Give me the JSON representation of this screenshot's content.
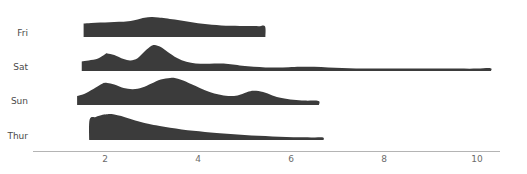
{
  "chart_data": {
    "type": "area",
    "subtype": "ridgeline",
    "title": "",
    "subtitle": "",
    "xlabel": "",
    "ylabel": "",
    "grid": false,
    "legend": null,
    "orientation": "horizontal",
    "fill_color": "#3b3b3b",
    "axis_color": "#b4b4b4",
    "label_color": "#4a4a4a",
    "tick_color": "#6b6b6b",
    "background": "#ffffff",
    "xlim": [
      0.2,
      10.8
    ],
    "xticks": [
      2,
      4,
      6,
      8,
      10
    ],
    "xtick_labels": [
      "2",
      "4",
      "6",
      "8",
      "10"
    ],
    "categories": [
      "Fri",
      "Sat",
      "Sun",
      "Thur"
    ],
    "series": [
      {
        "name": "Fri",
        "baseline_y": 37,
        "x_start": 1.54,
        "x_end": 5.45,
        "peak_x": 3.0,
        "peak_height": 20,
        "density_x": [
          1.54,
          1.7,
          1.9,
          2.1,
          2.3,
          2.5,
          2.7,
          2.85,
          3.0,
          3.15,
          3.3,
          3.5,
          3.7,
          3.9,
          4.1,
          4.3,
          4.5,
          4.7,
          4.9,
          5.1,
          5.3,
          5.44,
          5.45
        ],
        "density_y": [
          13.5,
          14.0,
          14.4,
          14.8,
          15.2,
          15.8,
          17.6,
          19.2,
          20.0,
          19.6,
          18.8,
          17.4,
          16.0,
          14.6,
          13.2,
          12.2,
          11.6,
          11.2,
          11.0,
          10.9,
          10.8,
          10.8,
          0.0
        ]
      },
      {
        "name": "Sat",
        "baseline_y": 71,
        "x_start": 1.5,
        "x_end": 10.3,
        "peak_x": 3.07,
        "peak_height": 26,
        "density_x": [
          1.5,
          1.65,
          1.85,
          2.0,
          2.05,
          2.2,
          2.4,
          2.55,
          2.7,
          2.85,
          3.0,
          3.07,
          3.2,
          3.35,
          3.55,
          3.75,
          3.95,
          4.15,
          4.35,
          4.55,
          4.75,
          4.95,
          5.2,
          5.45,
          5.7,
          5.95,
          6.2,
          6.5,
          6.8,
          7.1,
          7.4,
          7.7,
          8.0,
          8.4,
          8.8,
          9.2,
          9.6,
          10.0,
          10.29,
          10.3
        ],
        "density_y": [
          9.5,
          10.5,
          12.5,
          16.8,
          17.6,
          16.0,
          12.0,
          10.6,
          12.8,
          19.5,
          25.2,
          26.0,
          24.0,
          19.0,
          13.0,
          9.2,
          7.6,
          7.2,
          7.6,
          7.4,
          6.4,
          5.2,
          4.2,
          3.6,
          3.5,
          3.8,
          4.2,
          4.2,
          3.6,
          3.0,
          2.6,
          2.4,
          2.4,
          2.5,
          2.6,
          2.6,
          2.4,
          2.4,
          2.8,
          0.0
        ]
      },
      {
        "name": "Sun",
        "baseline_y": 105,
        "x_start": 1.4,
        "x_end": 6.6,
        "peak_x": 3.5,
        "peak_height": 27,
        "density_x": [
          1.4,
          1.55,
          1.75,
          1.95,
          2.05,
          2.2,
          2.4,
          2.6,
          2.8,
          3.0,
          3.2,
          3.4,
          3.5,
          3.65,
          3.85,
          4.05,
          4.25,
          4.45,
          4.65,
          4.85,
          5.05,
          5.2,
          5.4,
          5.6,
          5.8,
          6.05,
          6.3,
          6.59,
          6.6
        ],
        "density_y": [
          9.0,
          11.0,
          16.0,
          21.5,
          22.0,
          20.5,
          17.0,
          15.8,
          17.5,
          21.5,
          25.5,
          27.0,
          27.0,
          25.0,
          21.0,
          16.8,
          13.0,
          10.4,
          9.0,
          9.6,
          12.8,
          14.2,
          13.0,
          9.6,
          7.0,
          5.2,
          4.4,
          4.0,
          0.0
        ]
      },
      {
        "name": "Thur",
        "baseline_y": 140,
        "x_start": 1.66,
        "x_end": 6.7,
        "peak_x": 2.1,
        "peak_height": 26,
        "density_x": [
          1.66,
          1.67,
          1.8,
          1.95,
          2.05,
          2.1,
          2.2,
          2.35,
          2.55,
          2.75,
          2.95,
          3.15,
          3.4,
          3.65,
          3.9,
          4.15,
          4.4,
          4.7,
          5.0,
          5.3,
          5.6,
          5.9,
          6.2,
          6.5,
          6.69,
          6.7
        ],
        "density_y": [
          0.0,
          20.5,
          23.0,
          25.2,
          25.8,
          26.0,
          25.6,
          24.0,
          21.0,
          18.2,
          16.0,
          14.2,
          12.2,
          10.6,
          9.2,
          8.0,
          7.0,
          6.0,
          5.0,
          4.2,
          3.6,
          3.1,
          2.8,
          2.6,
          2.5,
          0.0
        ]
      }
    ]
  },
  "geometry": {
    "plot_left_px": 33,
    "plot_right_px": 500,
    "x_origin_px": 105,
    "px_per_unit": 46.5,
    "axis_y_px": 151,
    "tick_label_y_px": 156,
    "label_x_px": 28
  }
}
